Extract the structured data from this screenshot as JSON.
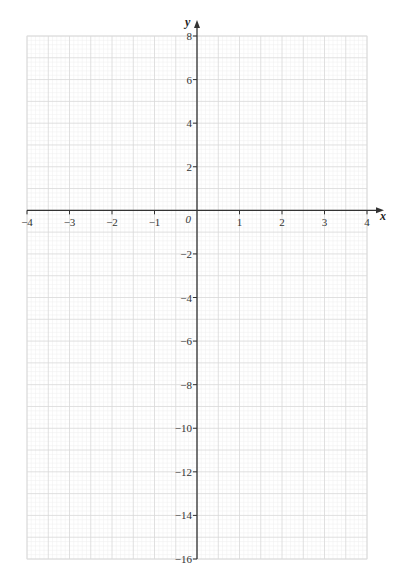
{
  "chart_data": {
    "type": "blank-grid",
    "title": "",
    "xlabel": "x",
    "ylabel": "y",
    "origin_label": "0",
    "xlim": [
      -4,
      4
    ],
    "ylim": [
      -16,
      8
    ],
    "x_ticks": [
      -4,
      -3,
      -2,
      -1,
      1,
      2,
      3,
      4
    ],
    "x_tick_labels": [
      "−4",
      "−3",
      "−2",
      "−1",
      "1",
      "2",
      "3",
      "4"
    ],
    "y_ticks": [
      8,
      6,
      4,
      2,
      -2,
      -4,
      -6,
      -8,
      -10,
      -12,
      -14,
      -16
    ],
    "y_tick_labels": [
      "8",
      "6",
      "4",
      "2",
      "−2",
      "−4",
      "−6",
      "−8",
      "−10",
      "−12",
      "−14",
      "−16"
    ],
    "grid": true,
    "series": []
  },
  "colors": {
    "axis": "#333333",
    "grid_major": "#d8d8d8",
    "grid_minor": "#efefef",
    "border": "#dddddd"
  }
}
